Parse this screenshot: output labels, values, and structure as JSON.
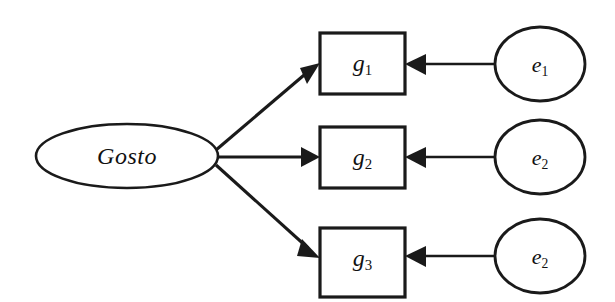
{
  "diagram": {
    "type": "path-diagram",
    "background_color": "#ffffff",
    "stroke_color": "#1a1a1a",
    "latent": {
      "id": "gosto",
      "shape": "ellipse",
      "label": "Gosto",
      "cx": 127,
      "cy": 156,
      "rx": 91,
      "ry": 32
    },
    "indicators": [
      {
        "id": "g1",
        "shape": "rectangle",
        "label_base": "g",
        "label_sub": "1",
        "label": "g1",
        "x": 320,
        "y": 33,
        "width": 85,
        "height": 61
      },
      {
        "id": "g2",
        "shape": "rectangle",
        "label_base": "g",
        "label_sub": "2",
        "label": "g2",
        "x": 320,
        "y": 127,
        "width": 85,
        "height": 61
      },
      {
        "id": "g3",
        "shape": "rectangle",
        "label_base": "g",
        "label_sub": "3",
        "label": "g3",
        "x": 320,
        "y": 228,
        "width": 85,
        "height": 69
      }
    ],
    "errors": [
      {
        "id": "e1",
        "shape": "circle",
        "label_base": "e",
        "label_sub": "1",
        "label": "e1",
        "cx": 540,
        "cy": 64,
        "rx": 45,
        "ry": 37
      },
      {
        "id": "e2",
        "shape": "circle",
        "label_base": "e",
        "label_sub": "2",
        "label": "e2",
        "cx": 540,
        "cy": 157,
        "rx": 45,
        "ry": 37
      },
      {
        "id": "e3",
        "shape": "circle",
        "label_base": "e",
        "label_sub": "2",
        "label": "e2",
        "cx": 540,
        "cy": 256,
        "rx": 45,
        "ry": 37
      }
    ],
    "edges": [
      {
        "id": "gosto-to-g1",
        "from": "gosto",
        "to": "g1",
        "arrow": "single",
        "direction": "right-up"
      },
      {
        "id": "gosto-to-g2",
        "from": "gosto",
        "to": "g2",
        "arrow": "single",
        "direction": "right"
      },
      {
        "id": "gosto-to-g3",
        "from": "gosto",
        "to": "g3",
        "arrow": "single",
        "direction": "right-down"
      },
      {
        "id": "e1-to-g1",
        "from": "e1",
        "to": "g1",
        "arrow": "single",
        "direction": "left"
      },
      {
        "id": "e2-to-g2",
        "from": "e2",
        "to": "g2",
        "arrow": "single",
        "direction": "left"
      },
      {
        "id": "e3-to-g3",
        "from": "e3",
        "to": "g3",
        "arrow": "single",
        "direction": "left"
      }
    ]
  }
}
